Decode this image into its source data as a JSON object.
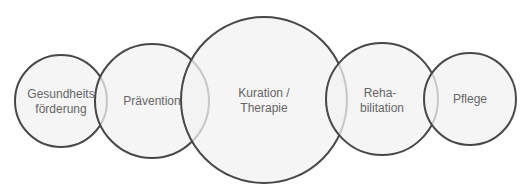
{
  "diagram": {
    "type": "overlapping-circles",
    "colors": {
      "fill": "#f2f2f2",
      "stroke": "#474747",
      "text": "#666666"
    },
    "circles": [
      {
        "id": "gesundheitsfoerderung",
        "lines": [
          "Gesundheits",
          "förderung"
        ],
        "cx": 61,
        "cy": 101,
        "r": 46
      },
      {
        "id": "praevention",
        "lines": [
          "Prävention"
        ],
        "cx": 152,
        "cy": 101,
        "r": 57
      },
      {
        "id": "kuration-therapie",
        "lines": [
          "Kuration /",
          "Therapie"
        ],
        "cx": 264,
        "cy": 100,
        "r": 83
      },
      {
        "id": "rehabilitation",
        "lines": [
          "Reha-",
          "bilitation"
        ],
        "cx": 382,
        "cy": 99,
        "r": 56
      },
      {
        "id": "pflege",
        "lines": [
          "Pflege"
        ],
        "cx": 470,
        "cy": 99,
        "r": 46
      }
    ]
  }
}
